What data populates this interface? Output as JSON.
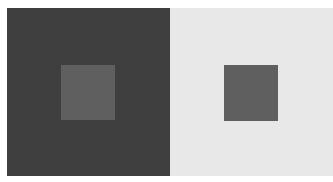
{
  "figure": {
    "type": "simultaneous-contrast-illusion",
    "background": "#ffffff",
    "panels": [
      {
        "name": "dark-surround",
        "x": 7,
        "y": 8,
        "w": 163,
        "h": 168,
        "color": "#3f3f3f",
        "inner": {
          "x": 61,
          "y": 65,
          "w": 54,
          "h": 55,
          "color": "#5f5f5f"
        }
      },
      {
        "name": "light-surround",
        "x": 170,
        "y": 8,
        "w": 163,
        "h": 168,
        "color": "#e8e8e8",
        "inner": {
          "x": 224,
          "y": 65,
          "w": 54,
          "h": 56,
          "color": "#5f5f5f"
        }
      }
    ]
  }
}
